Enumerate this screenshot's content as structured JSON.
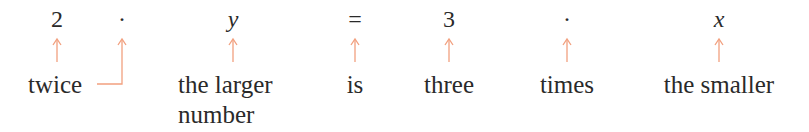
{
  "equation": {
    "symbols": [
      {
        "id": "two",
        "text": "2",
        "x": 57,
        "italic": false
      },
      {
        "id": "dot1",
        "text": "·",
        "x": 122,
        "italic": false
      },
      {
        "id": "y",
        "text": "y",
        "x": 233,
        "italic": true
      },
      {
        "id": "equals",
        "text": "=",
        "x": 355,
        "italic": false
      },
      {
        "id": "three",
        "text": "3",
        "x": 449,
        "italic": false
      },
      {
        "id": "dot2",
        "text": "·",
        "x": 567,
        "italic": false
      },
      {
        "id": "x",
        "text": "x",
        "x": 719,
        "italic": true
      }
    ]
  },
  "labels": {
    "twice": "twice",
    "the_larger": "the larger",
    "number": "number",
    "is": "is",
    "three": "three",
    "times": "times",
    "the_smaller": "the smaller"
  },
  "colors": {
    "arrow": "#f2a07f",
    "text": "#2a2a2a"
  }
}
